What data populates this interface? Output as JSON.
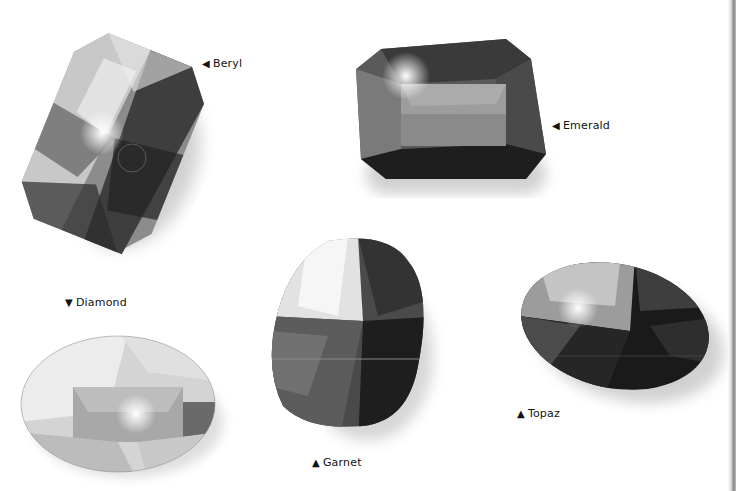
{
  "scene": {
    "background": "#ffffff",
    "palette": [
      "#111111",
      "#3a3a3a",
      "#6a6a6a",
      "#9a9a9a",
      "#cfcfcf",
      "#f2f2f2"
    ]
  },
  "gems": [
    {
      "id": "beryl",
      "name": "Beryl",
      "arrow": "◀",
      "arrow_icon": "triangle-left-icon",
      "shape": "cushion-rectangle",
      "tone": "medium-dark"
    },
    {
      "id": "emerald",
      "name": "Emerald",
      "arrow": "◀",
      "arrow_icon": "triangle-left-icon",
      "shape": "emerald-cut",
      "tone": "dark"
    },
    {
      "id": "diamond",
      "name": "Diamond",
      "arrow": "▼",
      "arrow_icon": "triangle-down-icon",
      "shape": "oval",
      "tone": "light"
    },
    {
      "id": "garnet",
      "name": "Garnet",
      "arrow": "▲",
      "arrow_icon": "triangle-up-icon",
      "shape": "cushion",
      "tone": "dark"
    },
    {
      "id": "topaz",
      "name": "Topaz",
      "arrow": "▲",
      "arrow_icon": "triangle-up-icon",
      "shape": "oval",
      "tone": "very-dark"
    }
  ]
}
